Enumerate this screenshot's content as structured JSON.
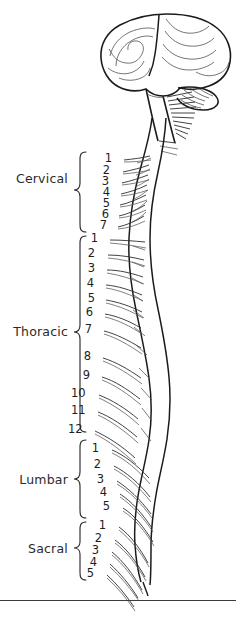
{
  "figure": {
    "background_color": "#ffffff",
    "ink_color": "#1b1b1b",
    "label_color": "#2b2b2b",
    "footer_rule": {
      "y": 600,
      "color": "#3b3b3b"
    }
  },
  "anatomy": {
    "brain": {
      "name": "brain",
      "parts": [
        "cerebrum",
        "cerebellum",
        "brainstem"
      ]
    },
    "spinal_cord": {
      "name": "spinal-cord"
    },
    "cauda_equina": {
      "name": "cauda-equina"
    }
  },
  "regions": [
    {
      "id": "cervical",
      "label": "Cervical",
      "label_x": 16,
      "label_y": 178,
      "brace": {
        "x": 72,
        "y_top": 152,
        "y_bottom": 232
      },
      "numbers": [
        "1",
        "2",
        "3",
        "4",
        "5",
        "6",
        "7"
      ],
      "number_x": [
        112,
        110,
        109,
        110,
        110,
        109,
        107
      ],
      "number_y": [
        158,
        170,
        181,
        192,
        203,
        214,
        225
      ]
    },
    {
      "id": "thoracic",
      "label": "Thoracic",
      "label_x": 14,
      "label_y": 331,
      "brace": {
        "x": 72,
        "y_top": 236,
        "y_bottom": 432
      },
      "numbers": [
        "1",
        "2",
        "3",
        "4",
        "5",
        "6",
        "7",
        "8",
        "9",
        "10",
        "11",
        "12"
      ],
      "number_x": [
        98,
        95,
        95,
        94,
        95,
        93,
        92,
        91,
        90,
        85,
        85,
        82
      ],
      "number_y": [
        238,
        253,
        268,
        283,
        298,
        312,
        329,
        356,
        375,
        393,
        410,
        429
      ]
    },
    {
      "id": "lumbar",
      "label": "Lumbar",
      "label_x": 18,
      "label_y": 479,
      "brace": {
        "x": 72,
        "y_top": 440,
        "y_bottom": 518
      },
      "numbers": [
        "1",
        "2",
        "3",
        "4",
        "5"
      ],
      "number_x": [
        99,
        101,
        104,
        107,
        110
      ],
      "number_y": [
        448,
        464,
        479,
        492,
        506
      ]
    },
    {
      "id": "sacral",
      "label": "Sacral",
      "label_x": 25,
      "label_y": 548,
      "brace": {
        "x": 72,
        "y_top": 522,
        "y_bottom": 580
      },
      "numbers": [
        "1",
        "2",
        "3",
        "4",
        "5"
      ],
      "number_x": [
        106,
        102,
        99,
        97,
        94
      ],
      "number_y": [
        525,
        538,
        550,
        562,
        573
      ]
    }
  ]
}
